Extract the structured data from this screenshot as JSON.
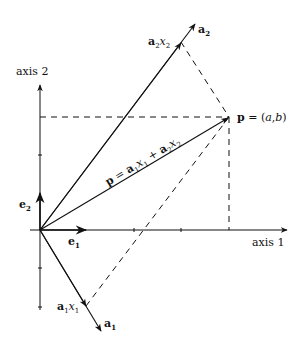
{
  "diagram": {
    "axes": {
      "x_label": "axis 1",
      "y_label": "axis 2"
    },
    "basis": {
      "e1_label": "e",
      "e1_sub": "1",
      "e2_label": "e",
      "e2_sub": "2"
    },
    "vectors": {
      "a1_label": "a",
      "a1_sub": "1",
      "a2_label": "a",
      "a2_sub": "2",
      "a1x1_label": "a",
      "a1x1_sub": "1",
      "a1x1_var": "x",
      "a1x1_var_sub": "1",
      "a2x2_label": "a",
      "a2x2_sub": "2",
      "a2x2_var": "x",
      "a2x2_var_sub": "2"
    },
    "point": {
      "name": "p",
      "eq": " = (",
      "a": "a",
      "comma": ",",
      "b": "b",
      "close": ")"
    },
    "sum_label": {
      "p": "p",
      "eq": " = ",
      "t1": "a",
      "t1_sub": "1",
      "t1_var": "x",
      "t1_var_sub": "1",
      "plus": " + ",
      "t2": "a",
      "t2_sub": "2",
      "t2_var": "x",
      "t2_var_sub": "2"
    },
    "colors": {
      "ink": "#111111",
      "background": "#ffffff"
    }
  }
}
